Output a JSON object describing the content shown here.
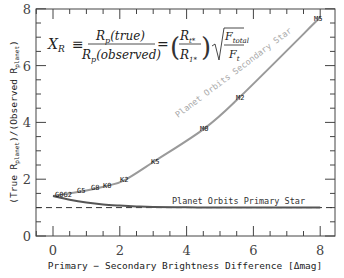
{
  "chart_data": {
    "type": "line",
    "title": "",
    "xlabel": "Primary − Secondary Brightness Difference [Δmag]",
    "ylabel": "(True R_planet)/(Observed R_planet)",
    "xlim": [
      -0.8,
      8.5
    ],
    "ylim": [
      0,
      8
    ],
    "xticks": [
      0,
      2,
      4,
      6,
      8
    ],
    "yticks": [
      0,
      2,
      4,
      6,
      8
    ],
    "grid": false,
    "equation": "X_R ≡ R_p(true)/R_p(observed) = (R_t*/R_1*) √(F_total/F_t)",
    "reference_line": {
      "y": 1,
      "style": "dashed"
    },
    "series": [
      {
        "name": "Planet Orbits Secondary Star",
        "color": "#9a9a9a",
        "x": [
          0,
          0.5,
          1.0,
          1.6,
          2.15,
          3.05,
          4.55,
          5.6,
          8.0
        ],
        "y": [
          1.41,
          1.5,
          1.6,
          1.76,
          1.97,
          2.64,
          3.8,
          4.9,
          7.7
        ],
        "point_labels": [
          {
            "label": "G0",
            "x": 0.0,
            "y": 1.41
          },
          {
            "label": "G2",
            "x": 0.4,
            "y": 1.47
          },
          {
            "label": "G5",
            "x": 0.85,
            "y": 1.55
          },
          {
            "label": "G8",
            "x": 1.25,
            "y": 1.63
          },
          {
            "label": "K0",
            "x": 1.6,
            "y": 1.76
          },
          {
            "label": "K2",
            "x": 2.15,
            "y": 1.97
          },
          {
            "label": "K5",
            "x": 3.05,
            "y": 2.64
          },
          {
            "label": "M0",
            "x": 4.55,
            "y": 3.8
          },
          {
            "label": "M2",
            "x": 5.6,
            "y": 4.9
          },
          {
            "label": "M5",
            "x": 8.0,
            "y": 7.7
          }
        ]
      },
      {
        "name": "Planet Orbits Primary Star",
        "color": "#555555",
        "x": [
          0,
          0.5,
          1.0,
          1.5,
          2.0,
          2.5,
          3.0,
          4.0,
          5.0,
          6.0,
          7.0,
          8.0
        ],
        "y": [
          1.41,
          1.28,
          1.18,
          1.11,
          1.07,
          1.04,
          1.02,
          1.01,
          1.0,
          1.0,
          1.0,
          1.0
        ]
      }
    ]
  },
  "labels": {
    "secondary_curve": "Planet Orbits Secondary Star",
    "primary_curve": "Planet Orbits Primary Star",
    "xlabel": "Primary − Secondary Brightness Difference [Δmag]",
    "ylabel_a": "(True R",
    "ylabel_sub1": "planet",
    "ylabel_b": ")/(Observed R",
    "ylabel_sub2": "planet",
    "ylabel_c": ")",
    "ticks_x": [
      "0",
      "2",
      "4",
      "6",
      "8"
    ],
    "ticks_y": [
      "0",
      "2",
      "4",
      "6",
      "8"
    ],
    "stars": [
      "G0G2",
      "G5",
      "G8",
      "K0",
      "K2",
      "K5",
      "M0",
      "M2",
      "M5"
    ],
    "eq": {
      "lhs": "X",
      "lhs_sub": "R",
      "equiv": "≡",
      "num": "R",
      "num_sub": "p",
      "num_arg": "(true)",
      "den": "R",
      "den_sub": "p",
      "den_arg": "(observed)",
      "eq": "=",
      "ratio_num": "R",
      "ratio_num_sub": "t*",
      "ratio_den": "R",
      "ratio_den_sub": "1*",
      "sqrt_num": "F",
      "sqrt_num_sub": "total",
      "sqrt_den": "F",
      "sqrt_den_sub": "t"
    }
  }
}
